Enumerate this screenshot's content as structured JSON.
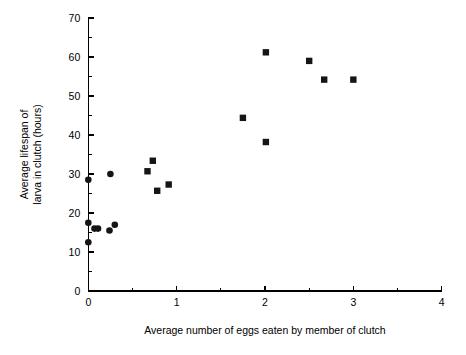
{
  "chart_data": {
    "type": "scatter",
    "title": "",
    "xlabel": "Average number of eggs eaten by member of clutch",
    "ylabel": "Average lifespan of larva in clutch (hours)",
    "ylabel_lines": [
      "Average lifespan of",
      "larva in clutch (hours)"
    ],
    "xlim": [
      0,
      4
    ],
    "ylim": [
      0,
      70
    ],
    "xticks": [
      0,
      1,
      2,
      3,
      4
    ],
    "yticks": [
      0,
      10,
      20,
      30,
      40,
      50,
      60,
      70
    ],
    "xtick_labels": [
      "0",
      "1",
      "2",
      "3",
      "4"
    ],
    "ytick_labels": [
      "0",
      "10",
      "20",
      "30",
      "40",
      "50",
      "60",
      "70"
    ],
    "x_minor_interval": 0.5,
    "y_minor_interval": 5,
    "grid": false,
    "legend": false,
    "legend_position": "none",
    "marker_color": "#151515",
    "axis_color": "#000000",
    "background_color": "#ffffff",
    "series": [
      {
        "name": "circle-markers",
        "marker": "circle",
        "points": [
          {
            "x": 0.0,
            "y": 28.5
          },
          {
            "x": 0.0,
            "y": 17.5
          },
          {
            "x": 0.0,
            "y": 12.5
          },
          {
            "x": 0.07,
            "y": 16.0
          },
          {
            "x": 0.11,
            "y": 16.0
          },
          {
            "x": 0.25,
            "y": 30.0
          },
          {
            "x": 0.24,
            "y": 15.5
          },
          {
            "x": 0.3,
            "y": 17.0
          }
        ]
      },
      {
        "name": "square-markers",
        "marker": "square",
        "points": [
          {
            "x": 0.67,
            "y": 30.7
          },
          {
            "x": 0.73,
            "y": 33.4
          },
          {
            "x": 0.78,
            "y": 25.7
          },
          {
            "x": 0.91,
            "y": 27.3
          },
          {
            "x": 1.75,
            "y": 44.4
          },
          {
            "x": 2.01,
            "y": 38.2
          },
          {
            "x": 2.01,
            "y": 61.2
          },
          {
            "x": 2.5,
            "y": 59.0
          },
          {
            "x": 2.67,
            "y": 54.2
          },
          {
            "x": 3.0,
            "y": 54.2
          }
        ]
      }
    ]
  }
}
